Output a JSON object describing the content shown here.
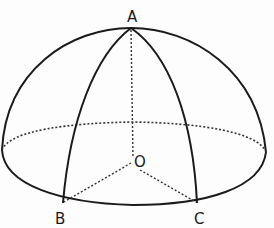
{
  "diagram": {
    "type": "hemisphere with spherical triangle",
    "points": {
      "A": {
        "label": "A",
        "role": "pole / top of hemisphere"
      },
      "O": {
        "label": "O",
        "role": "center of base circle"
      },
      "B": {
        "label": "B",
        "role": "point on base circle"
      },
      "C": {
        "label": "C",
        "role": "point on base circle"
      }
    },
    "labels": [
      "A",
      "O",
      "B",
      "C"
    ],
    "colors": {
      "ink": "#1a1a1a",
      "background": "#fdfdfd"
    }
  }
}
